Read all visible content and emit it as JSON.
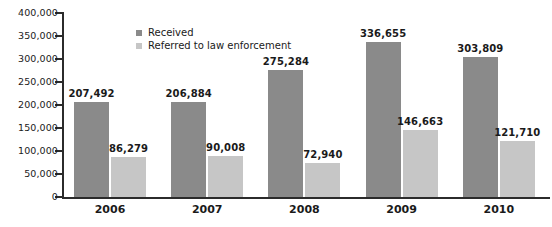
{
  "chart_data": {
    "type": "bar",
    "title": "",
    "subtitle": "",
    "xlabel": "",
    "ylabel": "",
    "categories": [
      "2006",
      "2007",
      "2008",
      "2009",
      "2010"
    ],
    "series": [
      {
        "name": "Received",
        "color": "#8a8a8a",
        "values": [
          207492,
          206884,
          275284,
          336655,
          303809
        ],
        "labels": [
          "207,492",
          "206,884",
          "275,284",
          "336,655",
          "303,809"
        ]
      },
      {
        "name": "Referred to law enforcement",
        "color": "#c6c6c6",
        "values": [
          86279,
          90008,
          72940,
          146663,
          121710
        ],
        "labels": [
          "86,279",
          "90,008",
          "72,940",
          "146,663",
          "121,710"
        ]
      }
    ],
    "ylim": [
      0,
      400000
    ],
    "ytick_values": [
      0,
      50000,
      100000,
      150000,
      200000,
      250000,
      300000,
      350000,
      400000
    ],
    "ytick_labels": [
      "0",
      "50,000",
      "100,000",
      "150,000",
      "200,000",
      "250,000",
      "300,000",
      "350,000",
      "400,000"
    ],
    "grid": false,
    "legend_position": "top-left-inside",
    "axis_color": "#2b2b2b",
    "background_color": "#ffffff"
  },
  "legend": {
    "items": [
      {
        "label": "Received",
        "swatch": "received-swatch"
      },
      {
        "label": "Referred to law enforcement",
        "swatch": "referred-swatch"
      }
    ]
  }
}
